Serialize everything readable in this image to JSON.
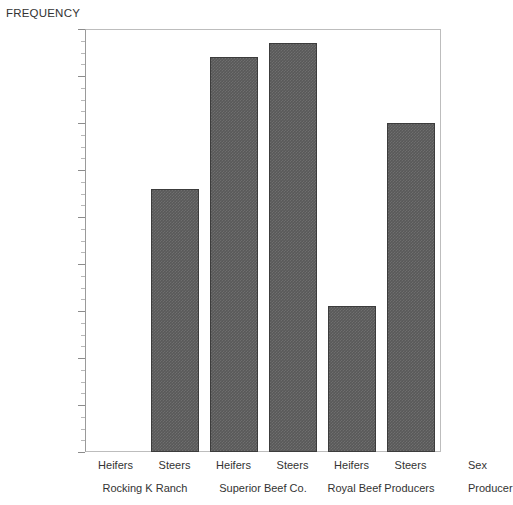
{
  "chart_data": {
    "type": "bar",
    "title": "",
    "ylabel": "FREQUENCY",
    "xlabel": "",
    "ylim": [
      0,
      90
    ],
    "ytick_step": 10,
    "yminor_step": 2.5,
    "grid": false,
    "legend": false,
    "bar_color": "#595959",
    "bar_edge_color": "#3c3c3c",
    "axis_color": "#bdbdbd",
    "categories": [
      "Rocking K Ranch / Heifers",
      "Rocking K Ranch / Steers",
      "Superior Beef Co. / Heifers",
      "Superior Beef Co. / Steers",
      "Royal Beef Producers / Heifers",
      "Royal Beef Producers / Steers"
    ],
    "values": [
      0,
      56,
      84,
      87,
      31,
      70
    ],
    "yticks": [
      0,
      10,
      20,
      30,
      40,
      50,
      60,
      70,
      80,
      90
    ],
    "ytick_labels": [
      "0",
      "10",
      "20",
      "30",
      "40",
      "50",
      "60",
      "70",
      "80",
      "90"
    ],
    "groups": [
      {
        "label": "Rocking K Ranch",
        "bars": [
          {
            "label": "Heifers",
            "value": 0
          },
          {
            "label": "Steers",
            "value": 56
          }
        ]
      },
      {
        "label": "Superior Beef Co.",
        "bars": [
          {
            "label": "Heifers",
            "value": 84
          },
          {
            "label": "Steers",
            "value": 87
          }
        ]
      },
      {
        "label": "Royal Beef Producers",
        "bars": [
          {
            "label": "Heifers",
            "value": 31
          },
          {
            "label": "Steers",
            "value": 70
          }
        ]
      }
    ],
    "axis_names": {
      "sub": "Sex",
      "group": "Producer"
    }
  }
}
